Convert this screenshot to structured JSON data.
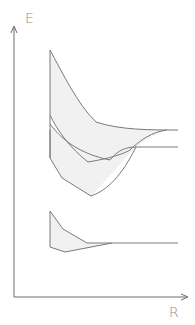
{
  "diagram": {
    "title": "",
    "y_axis_label": "E",
    "x_axis_label": "R",
    "colors": {
      "line": "#7a7a7a",
      "band_fill": "#f1f1f1",
      "axis": "#6e6e6e",
      "label": "#8a8a8a"
    },
    "bands": [
      {
        "name": "upper-energy-band",
        "description": "broad band converging at large R"
      },
      {
        "name": "middle-energy-band",
        "description": "band converging at large R"
      },
      {
        "name": "lower-energy-band",
        "description": "narrow band converging at large R"
      }
    ]
  }
}
